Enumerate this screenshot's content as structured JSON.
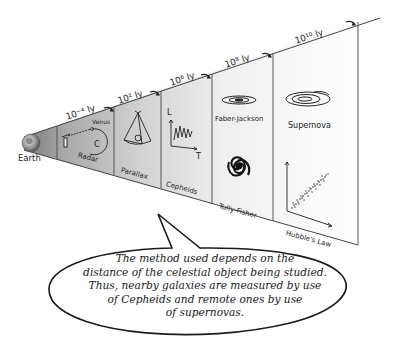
{
  "diagram": {
    "origin_label": "Earth",
    "distance_labels": [
      "10⁻⁴ ly",
      "10² ly",
      "10⁶ ly",
      "10⁸ ly",
      "10¹⁰ ly"
    ],
    "sections": [
      {
        "id": "radar",
        "label": "Radar",
        "sublabel": "Venus",
        "scale": "10⁻⁴ ly"
      },
      {
        "id": "parallax",
        "label": "Parallax",
        "scale": "10² ly"
      },
      {
        "id": "cepheids",
        "label": "Cepheids",
        "scale": "10⁶ ly",
        "axes": {
          "y": "L",
          "x": "T"
        }
      },
      {
        "id": "faber-jackson-tully-fisher",
        "top_label": "Faber-Jackson",
        "bottom_label": "Tully-Fisher",
        "scale": "10⁸ ly"
      },
      {
        "id": "supernova-hubble",
        "top_label": "Supernova",
        "bottom_label": "Hubble's Law",
        "scale": "10¹⁰ ly"
      }
    ],
    "callout_lines": [
      "The method used depends on the",
      "distance of the celestial object being studied.",
      "Thus, nearby galaxies are measured by use",
      "of Cepheids and remote ones by use",
      "of supernovas."
    ],
    "colors": {
      "ink": "#222222",
      "shade_dark": "#8a8a8a",
      "shade_mid": "#c4c4c4",
      "shade_light": "#e6e6e6",
      "background": "#ffffff"
    }
  }
}
